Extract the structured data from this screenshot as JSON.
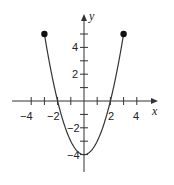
{
  "chart_data": {
    "type": "line",
    "title": "",
    "function": "y = x^2 - 4",
    "xlabel": "x",
    "ylabel": "y",
    "xlim": [
      -5.5,
      5.5
    ],
    "ylim": [
      -5.3,
      6.4
    ],
    "grid": false,
    "domain": [
      -3,
      3
    ],
    "endpoints": [
      {
        "x": -3,
        "y": 5,
        "style": "closed"
      },
      {
        "x": 3,
        "y": 5,
        "style": "closed"
      }
    ],
    "x_ticks": [
      -4,
      -3,
      -2,
      -1,
      1,
      2,
      3,
      4
    ],
    "x_tick_labels": [
      "-4",
      "-2",
      "2",
      "4"
    ],
    "y_ticks": [
      -4,
      -3,
      -2,
      -1,
      1,
      2,
      3,
      4,
      5
    ],
    "y_tick_labels": [
      "4",
      "2",
      "-2",
      "-4"
    ],
    "series": [
      {
        "name": "parabola",
        "x": [
          -3,
          -2.5,
          -2,
          -1.5,
          -1,
          -0.5,
          0,
          0.5,
          1,
          1.5,
          2,
          2.5,
          3
        ],
        "values": [
          5,
          2.25,
          0,
          -1.75,
          -3,
          -3.75,
          -4,
          -3.75,
          -3,
          -1.75,
          0,
          2.25,
          5
        ]
      }
    ],
    "key_points": {
      "vertex": {
        "x": 0,
        "y": -4
      },
      "x_intercepts": [
        -2,
        2
      ],
      "y_intercept": -4
    }
  },
  "labels": {
    "x_axis": "x",
    "y_axis": "y",
    "xt_m4": "−4",
    "xt_m2": "−2",
    "xt_2": "2",
    "xt_4": "4",
    "yt_4": "4",
    "yt_2": "2",
    "yt_m2": "−2",
    "yt_m4": "−4"
  },
  "colors": {
    "curve": "#333333",
    "axis": "#333333",
    "point": "#111111"
  }
}
